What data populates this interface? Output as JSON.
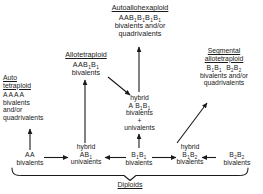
{
  "diagram": {
    "bottom_bracket_label": "Diploids",
    "nodes": {
      "autoallohexaploid": {
        "title": "Autoallohexaploid",
        "formula_html": "AAB1B1B1B1",
        "formula_plain": "AAB₁B₁B₁B₁",
        "line1": "bivalents and/or",
        "line2": "quadrivalents"
      },
      "allotetraploid": {
        "title": "Allotetraploid",
        "formula_plain": "AAB₁B₁",
        "line1": "bivalents"
      },
      "segmental_allotetraploid": {
        "title_line1": "Segmental",
        "title_line2": "allotetraploid",
        "formula_plain": "B₁B₁  B₂B₂",
        "line1": "bivalents and/or",
        "line2": "quadrivalents"
      },
      "autotetraploid": {
        "title_line1": "Auto",
        "title_line2": "tetraploid",
        "formula_plain": "AAAA",
        "line1": "bivalents",
        "line2": "and/or",
        "line3": "quadrivalents"
      },
      "hybrid_ab1b1": {
        "label": "hybrid",
        "formula_plain": "A B₁B₁",
        "line1": "bivalents",
        "line2": "+",
        "line3": "univalents"
      },
      "aa": {
        "formula_plain": "AA",
        "line1": "bivalents"
      },
      "hybrid_ab1": {
        "label": "hybrid",
        "formula_plain": "AB₁",
        "line1": "univalents"
      },
      "b1b1": {
        "formula_plain": "B₁B₁",
        "line1": "bivalents"
      },
      "hybrid_b1b2": {
        "label": "hybrid",
        "formula_plain": "B₁B₂",
        "line1": "bivalents"
      },
      "b2b2": {
        "formula_plain": "B₂B₂",
        "line1": "bivalents"
      }
    },
    "colors": {
      "ink": "#1a1a1a",
      "background": "#ffffff"
    }
  }
}
